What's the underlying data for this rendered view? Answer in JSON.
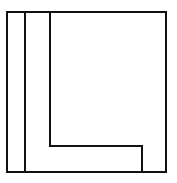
{
  "diagram": {
    "stroke_color": "#111111",
    "background": "#ffffff",
    "stroke_width": 2,
    "outer_box": {
      "x": 7,
      "y": 12,
      "width": 159,
      "height": 160
    },
    "left_strip_line": {
      "x": 25,
      "y1": 12,
      "y2": 172
    },
    "l_shape_path": "M50 12 L50 146 L142 146 L142 172"
  }
}
